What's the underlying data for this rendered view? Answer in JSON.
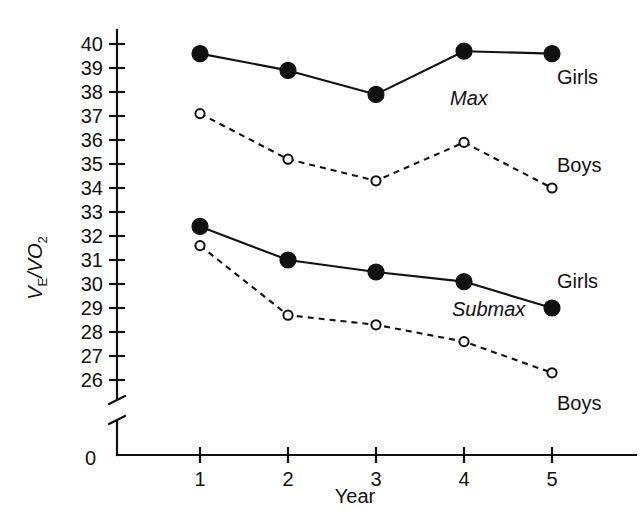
{
  "chart_data": {
    "type": "line",
    "title": "",
    "xlabel": "Year",
    "ylabel": "VE/VO2",
    "ylabel_parts": {
      "v1": "V",
      "sub1": "E",
      "slash": "/",
      "v2": "VO",
      "sub2": "2"
    },
    "x": [
      1,
      2,
      3,
      4,
      5
    ],
    "xtick_labels": [
      "1",
      "2",
      "3",
      "4",
      "5"
    ],
    "ytick_labels": [
      "40",
      "39",
      "38",
      "37",
      "36",
      "35",
      "34",
      "33",
      "32",
      "31",
      "30",
      "29",
      "28",
      "27",
      "26"
    ],
    "ytick_values": [
      40,
      39,
      38,
      37,
      36,
      35,
      34,
      33,
      32,
      31,
      30,
      29,
      28,
      27,
      26
    ],
    "origin_label": "0",
    "ylim": [
      26,
      40
    ],
    "axis_break": true,
    "grid": false,
    "legend_position": "inline-right",
    "series": [
      {
        "name": "Max Girls",
        "group": "Max",
        "label": "Girls",
        "marker": "filled-circle",
        "linestyle": "solid",
        "values": [
          39.6,
          38.9,
          37.9,
          39.7,
          39.6
        ]
      },
      {
        "name": "Max Boys",
        "group": "Max",
        "label": "Boys",
        "marker": "open-circle",
        "linestyle": "dashed",
        "values": [
          37.1,
          35.2,
          34.3,
          35.9,
          34.0
        ]
      },
      {
        "name": "Submax Girls",
        "group": "Submax",
        "label": "Girls",
        "marker": "filled-circle",
        "linestyle": "solid",
        "values": [
          32.4,
          31.0,
          30.5,
          30.1,
          29.0
        ]
      },
      {
        "name": "Submax Boys",
        "group": "Submax",
        "label": "Boys",
        "marker": "open-circle",
        "linestyle": "dashed",
        "values": [
          31.6,
          28.7,
          28.3,
          27.6,
          26.3
        ]
      }
    ],
    "annotations": [
      {
        "text": "Max",
        "style": "italic"
      },
      {
        "text": "Submax",
        "style": "italic"
      }
    ],
    "colors": {
      "line": "#111111",
      "marker_fill": "#111111",
      "marker_open_fill": "#ffffff",
      "background": "#ffffff"
    }
  },
  "labels": {
    "max_group": "Max",
    "submax_group": "Submax",
    "max_girls": "Girls",
    "max_boys": "Boys",
    "submax_girls": "Girls",
    "submax_boys": "Boys"
  }
}
